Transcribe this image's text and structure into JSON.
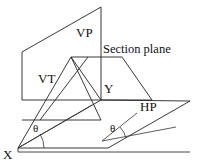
{
  "figure": {
    "canvas": {
      "width": 202,
      "height": 167,
      "background": "#ffffff"
    },
    "stroke_color": "#222222",
    "labels": {
      "vp": "VP",
      "section_plane": "Section plane",
      "vt": "VT",
      "y": "Y",
      "hp": "HP",
      "x": "X",
      "theta_left": "θ",
      "theta_right": "θ"
    },
    "geometry": {
      "vertical_plane_vp": [
        [
          22,
          52
        ],
        [
          101,
          7
        ],
        [
          101,
          100
        ],
        [
          22,
          100
        ]
      ],
      "horizontal_plane_hp": [
        [
          18,
          148
        ],
        [
          101,
          100
        ],
        [
          190,
          101
        ],
        [
          108,
          148
        ]
      ],
      "ground_line_xy": [
        [
          18,
          148
        ],
        [
          101,
          100
        ]
      ],
      "section_plane_quad": [
        [
          71,
          57
        ],
        [
          101,
          100
        ],
        [
          152,
          100
        ],
        [
          122,
          57
        ]
      ],
      "vt_trace_line": [
        [
          18,
          148
        ],
        [
          71,
          57
        ]
      ],
      "vt_parallel_line": [
        [
          40,
          120
        ],
        [
          88,
          57
        ]
      ],
      "base_edge_front": [
        [
          18,
          148
        ],
        [
          108,
          148
        ]
      ],
      "base_edge_lower": [
        [
          18,
          152
        ],
        [
          190,
          152
        ]
      ],
      "angle_ray_left": [
        [
          18,
          148
        ],
        [
          78,
          112
        ]
      ],
      "angle_ray_right": [
        [
          102,
          140
        ],
        [
          166,
          126
        ]
      ],
      "angle_arc_left_deg": 31,
      "angle_arc_right_deg": 28
    }
  }
}
